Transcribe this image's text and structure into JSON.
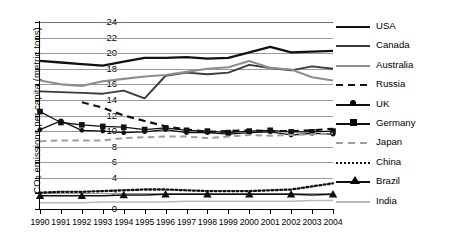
{
  "chart_data": {
    "type": "line",
    "title": "",
    "xlabel": "",
    "ylabel": "CO2 emissions per capita (metric tons)",
    "ylabel_parts": {
      "pre": "CO",
      "sub": "2",
      "post": " emissions per capita (metric tons)"
    },
    "x": [
      1990,
      1991,
      1992,
      1993,
      1994,
      1995,
      1996,
      1997,
      1998,
      1999,
      2000,
      2001,
      2002,
      2003,
      2004
    ],
    "xlim": [
      1990,
      2004
    ],
    "ylim": [
      0,
      24
    ],
    "yticks": [
      0,
      2,
      4,
      6,
      8,
      10,
      12,
      14,
      16,
      18,
      20,
      22,
      24
    ],
    "xticks": [
      "1990",
      "1991",
      "1992",
      "1993",
      "1994",
      "1995",
      "1996",
      "1997",
      "1998",
      "1999",
      "2000",
      "2001",
      "2002",
      "2003",
      "2004"
    ],
    "grid": true,
    "legend_position": "right",
    "series": [
      {
        "name": "USA",
        "color": "#111111",
        "style": "solid",
        "width": 2.3,
        "marker": "none",
        "values": [
          19.0,
          18.8,
          18.6,
          18.4,
          18.9,
          19.4,
          19.4,
          19.5,
          19.3,
          19.4,
          20.1,
          20.8,
          20.1,
          20.2,
          20.3
        ]
      },
      {
        "name": "Canada",
        "color": "#3b3b3b",
        "style": "solid",
        "width": 1.9,
        "marker": "none",
        "values": [
          15.1,
          15.0,
          14.9,
          14.8,
          15.2,
          14.2,
          17.1,
          17.5,
          17.3,
          17.5,
          18.5,
          18.1,
          17.8,
          18.3,
          18.0
        ]
      },
      {
        "name": "Australia",
        "color": "#8e8e8e",
        "style": "solid",
        "width": 2.1,
        "marker": "none",
        "values": [
          16.5,
          16.0,
          15.8,
          16.4,
          16.7,
          17.0,
          17.2,
          17.6,
          18.0,
          18.2,
          19.0,
          18.1,
          17.9,
          16.9,
          16.5
        ]
      },
      {
        "name": "Russia",
        "color": "#111111",
        "style": "dashed",
        "width": 2.2,
        "marker": "none",
        "values": [
          null,
          null,
          13.7,
          13.0,
          12.0,
          11.3,
          10.6,
          10.2,
          9.9,
          10.0,
          10.1,
          10.0,
          10.0,
          10.1,
          10.3
        ]
      },
      {
        "name": "UK",
        "color": "#111111",
        "style": "solid",
        "width": 1.3,
        "marker": "circle",
        "values": [
          10.2,
          11.3,
          10.1,
          10.0,
          9.8,
          9.9,
          10.2,
          9.8,
          9.8,
          9.6,
          9.8,
          9.9,
          9.5,
          9.7,
          9.6
        ]
      },
      {
        "name": "Germany",
        "color": "#111111",
        "style": "solid",
        "width": 1.3,
        "marker": "square",
        "values": [
          12.5,
          11.1,
          10.8,
          10.6,
          10.5,
          10.2,
          10.4,
          10.1,
          10.0,
          9.8,
          10.0,
          10.1,
          9.9,
          9.9,
          10.0
        ]
      },
      {
        "name": "Japan",
        "color": "#9e9e9e",
        "style": "dashed",
        "width": 2.0,
        "marker": "none",
        "values": [
          8.7,
          8.8,
          8.8,
          8.8,
          9.1,
          9.2,
          9.3,
          9.3,
          9.1,
          9.3,
          9.5,
          9.4,
          9.5,
          9.6,
          9.7
        ]
      },
      {
        "name": "China",
        "color": "#111111",
        "style": "dotted",
        "width": 2.3,
        "marker": "none",
        "values": [
          2.1,
          2.2,
          2.2,
          2.3,
          2.4,
          2.5,
          2.5,
          2.4,
          2.3,
          2.3,
          2.3,
          2.4,
          2.5,
          2.9,
          3.3
        ]
      },
      {
        "name": "Brazil",
        "color": "#111111",
        "style": "solid",
        "width": 1.5,
        "marker": "triangle",
        "values": [
          1.7,
          1.7,
          1.7,
          1.7,
          1.8,
          1.8,
          1.9,
          1.9,
          1.9,
          1.9,
          1.9,
          1.9,
          1.9,
          1.8,
          1.9
        ]
      },
      {
        "name": "India",
        "color": "#b9b9b9",
        "style": "solid",
        "width": 1.6,
        "marker": "none",
        "values": [
          0.8,
          0.8,
          0.8,
          0.9,
          0.9,
          0.9,
          0.9,
          1.0,
          1.0,
          1.0,
          1.0,
          1.0,
          1.0,
          1.1,
          1.1
        ]
      }
    ]
  }
}
